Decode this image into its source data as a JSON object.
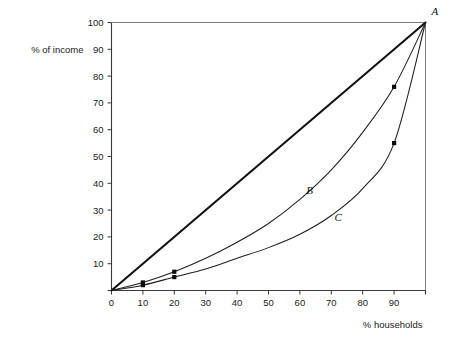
{
  "chart_data": {
    "type": "line",
    "title": "",
    "subtitle": "",
    "xlabel": "% households",
    "ylabel": "% of income",
    "xlim": [
      0,
      100
    ],
    "ylim": [
      0,
      100
    ],
    "grid": false,
    "legend_position": "inline-curve-labels",
    "x_ticks": [
      0,
      10,
      20,
      30,
      40,
      50,
      60,
      70,
      80,
      90,
      100
    ],
    "x_tick_labels": [
      "0",
      "10",
      "20",
      "30",
      "40",
      "50",
      "60",
      "70",
      "80",
      "90",
      ""
    ],
    "y_ticks": [
      0,
      10,
      20,
      30,
      40,
      50,
      60,
      70,
      80,
      90,
      100
    ],
    "y_tick_labels": [
      "",
      "10",
      "20",
      "30",
      "40",
      "50",
      "60",
      "70",
      "80",
      "90",
      "100"
    ],
    "series": [
      {
        "name": "A",
        "label": "A",
        "description": "line of equality",
        "style": "straight-thick",
        "x": [
          0,
          100
        ],
        "values": [
          0,
          100
        ],
        "markers": []
      },
      {
        "name": "B",
        "label": "B",
        "description": "Lorenz curve B",
        "style": "curve-thin",
        "x": [
          0,
          10,
          20,
          30,
          40,
          50,
          60,
          70,
          80,
          90,
          100
        ],
        "values": [
          0,
          3,
          7,
          12,
          18,
          25,
          34,
          45,
          59,
          76,
          100
        ],
        "markers": [
          {
            "x": 10,
            "y": 3
          },
          {
            "x": 20,
            "y": 7
          },
          {
            "x": 90,
            "y": 76
          }
        ]
      },
      {
        "name": "C",
        "label": "C",
        "description": "Lorenz curve C",
        "style": "curve-thin",
        "x": [
          0,
          10,
          20,
          30,
          40,
          50,
          60,
          70,
          80,
          90,
          100
        ],
        "values": [
          0,
          2,
          5,
          8,
          12,
          16,
          21,
          28,
          38,
          55,
          100
        ],
        "markers": [
          {
            "x": 10,
            "y": 2
          },
          {
            "x": 20,
            "y": 5
          },
          {
            "x": 90,
            "y": 55
          }
        ]
      }
    ],
    "annotations": [
      {
        "text": "A",
        "x": 100,
        "y": 100,
        "placement": "outside-top-right"
      },
      {
        "text": "B",
        "x": 62,
        "y": 36,
        "placement": "inline"
      },
      {
        "text": "C",
        "x": 71,
        "y": 26,
        "placement": "inline"
      }
    ]
  },
  "labels": {
    "y_axis_title": "% of income",
    "x_axis_title": "% households",
    "curve_a": "A",
    "curve_b": "B",
    "curve_c": "C"
  },
  "colors": {
    "background": "#ffffff",
    "axis": "#3a3a3a",
    "frame": "#7d7d7d",
    "curve": "#1e1e1e",
    "equality_line": "#111111",
    "marker": "#0d0d0d",
    "text": "#1a1a1a"
  }
}
